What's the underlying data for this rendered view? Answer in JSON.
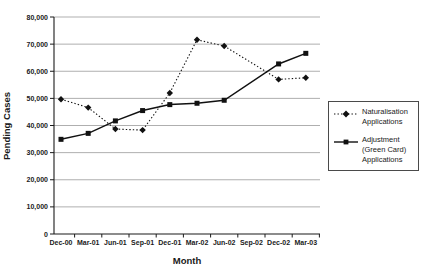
{
  "chart_data": {
    "type": "line",
    "title": "",
    "xlabel": "Month",
    "ylabel": "Pending Cases",
    "categories": [
      "Dec-00",
      "Mar-01",
      "Jun-01",
      "Sep-01",
      "Dec-01",
      "Mar-02",
      "Jun-02",
      "Sep-02",
      "Dec-02",
      "Mar-03"
    ],
    "series": [
      {
        "id": "naturalisation",
        "name": "Naturalisation Applications",
        "line_style": "dotted",
        "marker": "diamond",
        "color": "#111111",
        "values": [
          49700,
          46600,
          38700,
          38300,
          52000,
          71600,
          69300,
          null,
          57000,
          57600
        ]
      },
      {
        "id": "adjustment",
        "name": "Adjustment (Green Card) Applications",
        "line_style": "solid",
        "marker": "square",
        "color": "#111111",
        "values": [
          34900,
          37100,
          41700,
          45500,
          47700,
          48200,
          49300,
          null,
          62700,
          66600
        ]
      }
    ],
    "ylim": [
      0,
      80000
    ],
    "yticks": {
      "values": [
        0,
        10000,
        20000,
        30000,
        40000,
        50000,
        60000,
        70000,
        80000
      ],
      "labels": [
        "0",
        "10,000",
        "20,000",
        "30,000",
        "40,000",
        "50,000",
        "60,000",
        "70,000",
        "80,000"
      ]
    },
    "grid": "horizontal",
    "legend_position": "right",
    "colors": {
      "line": "#111111",
      "gridline": "#a6a6a6",
      "axis": "#1a1a1a",
      "background": "#ffffff"
    }
  }
}
